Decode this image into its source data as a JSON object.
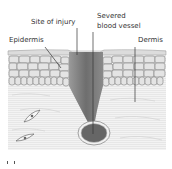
{
  "diagram": {
    "labels": {
      "site_of_injury": "Site of injury",
      "severed_blood_vessel_line1": "Severed",
      "severed_blood_vessel_line2": "blood vessel",
      "epidermis": "Epidermis",
      "dermis": "Dermis"
    },
    "colors": {
      "wound": "#7a7a7a",
      "blood_vessel": "#6a6a6a",
      "cells": "#e6e6e6",
      "cell_outline": "#8a8a8a",
      "dermis_bg": "#f0f0f0",
      "leader_line": "#333333"
    }
  }
}
